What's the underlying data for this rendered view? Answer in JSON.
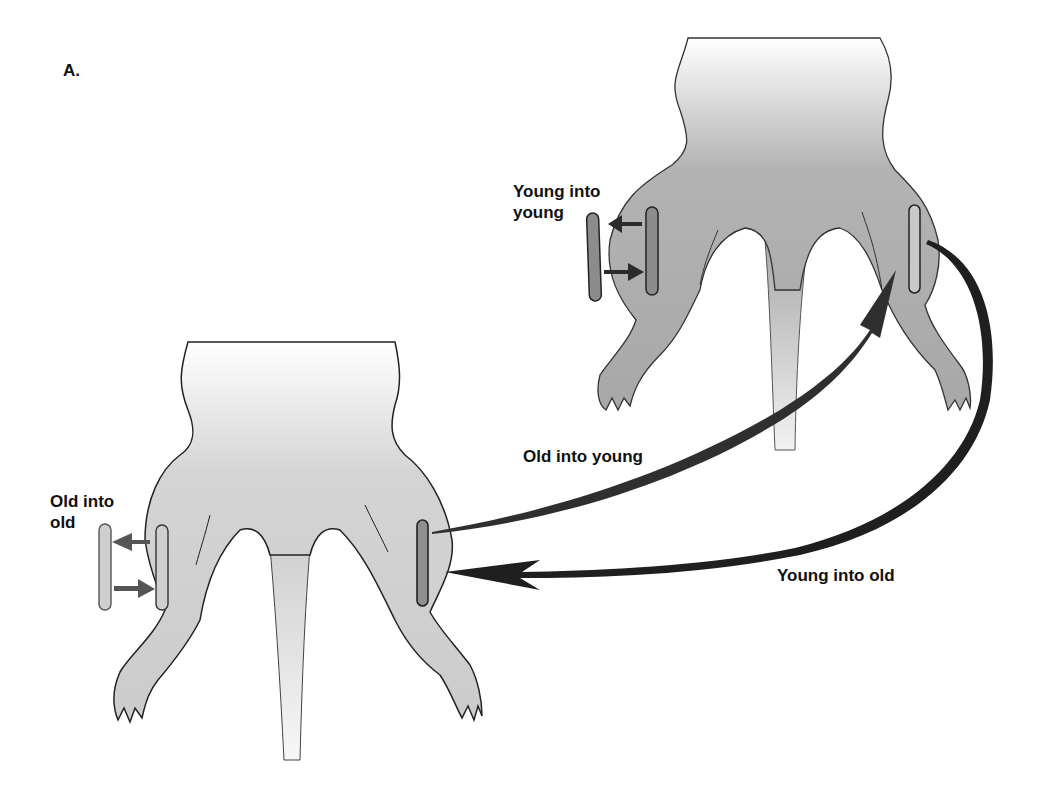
{
  "figure": {
    "panel_label": "A.",
    "labels": {
      "young_into_young_1": "Young into",
      "young_into_young_2": "young",
      "old_into_old_1": "Old into",
      "old_into_old_2": "old",
      "old_into_young": "Old into young",
      "young_into_old": "Young into old"
    },
    "colors": {
      "young_mouse_fill": "#a9a9a9",
      "old_mouse_fill": "#cfcfcf",
      "outline": "#222222",
      "graft_dark": "#8c8c8c",
      "graft_light": "#bdbdbd",
      "arrow": "#2b2b2b"
    },
    "mice": [
      {
        "name": "young mouse",
        "position": "top-right"
      },
      {
        "name": "old mouse",
        "position": "bottom-left"
      }
    ]
  }
}
